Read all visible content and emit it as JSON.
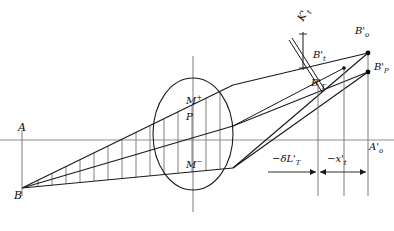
{
  "figure": {
    "type": "optical-ray-diagram",
    "background_color": "#ffffff",
    "stroke_color": "#1a1a1a",
    "hatch_color": "#3a3a3a",
    "axis_color": "#888888",
    "width": 394,
    "height": 231
  },
  "axis": {
    "name": "optical-axis",
    "y": 140,
    "x_start": 0,
    "x_end": 394,
    "left_label": "A",
    "right_label_main": "A",
    "right_label_prime": "'",
    "right_label_sub": "o"
  },
  "object": {
    "point_label": "B",
    "x": 22,
    "y": 188
  },
  "lens": {
    "name": "lens-ellipse",
    "center_x": 193,
    "center_y": 134,
    "rx": 40,
    "ry": 56,
    "axis_vertical_x": 193
  },
  "lens_labels": [
    {
      "id": "m-plus",
      "text": "M",
      "sup": "+",
      "x": 192,
      "y": 100
    },
    {
      "id": "p-point",
      "text": "P",
      "sup": "",
      "x": 190,
      "y": 117
    },
    {
      "id": "m-minus",
      "text": "M",
      "sup": "−",
      "x": 192,
      "y": 163
    }
  ],
  "image_points": [
    {
      "id": "b-o-prime",
      "base": "B",
      "prime": "'",
      "sub": "o",
      "dot_x": 368,
      "dot_y": 53,
      "label_x": 358,
      "label_y": 32
    },
    {
      "id": "b-p-prime",
      "base": "B",
      "prime": "'",
      "sub": "P",
      "dot_x": 368,
      "dot_y": 72,
      "label_x": 374,
      "label_y": 67
    },
    {
      "id": "b-t-prime",
      "base": "B",
      "prime": "'",
      "sub": "t",
      "dot_x": 344,
      "dot_y": 68,
      "label_x": 316,
      "label_y": 55
    },
    {
      "id": "b-T-prime",
      "base": "B",
      "prime": "'",
      "sub": "T",
      "dot_x": 318,
      "dot_y": 84,
      "label_x": 313,
      "label_y": 82
    }
  ],
  "annotation": {
    "id": "k-t-prime",
    "base": "K",
    "prime": "'",
    "sub": "t",
    "rotation_deg": -62,
    "x": 300,
    "y": 27
  },
  "dimensions": [
    {
      "id": "delta-l-t-prime",
      "text": "−δL",
      "prime": "'",
      "sub": "T",
      "label_x": 275,
      "label_y": 160,
      "line_y": 172,
      "x_from": 268,
      "x_to": 318
    },
    {
      "id": "x-t-prime",
      "text": "−x",
      "prime": "'",
      "sub": "t",
      "label_x": 328,
      "label_y": 160,
      "line_y": 172,
      "x_from": 318,
      "x_to": 368
    }
  ],
  "vertical_droplines": [
    {
      "id": "dropline-bT",
      "x": 318,
      "y_top": 84,
      "y_bottom": 196
    },
    {
      "id": "dropline-bt",
      "x": 344,
      "y_top": 68,
      "y_bottom": 196
    },
    {
      "id": "dropline-bo",
      "x": 368,
      "y_top": 53,
      "y_bottom": 196
    },
    {
      "id": "dropline-A",
      "x": 22,
      "y_top": 130,
      "y_bottom": 196
    }
  ]
}
